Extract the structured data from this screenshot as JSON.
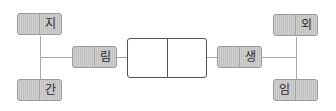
{
  "diagram": {
    "type": "fishbone-word-map",
    "left_group": {
      "top_box": {
        "left_text": "",
        "right_text": "지"
      },
      "bottom_box": {
        "left_text": "",
        "right_text": "간"
      },
      "connector_box": {
        "left_text": "",
        "right_text": "림"
      }
    },
    "center_box": {
      "left_text": "",
      "right_text": ""
    },
    "right_group": {
      "connector_box": {
        "left_text": "",
        "right_text": "생"
      },
      "top_box": {
        "left_text": "",
        "right_text": "외"
      },
      "bottom_box": {
        "left_text": "임",
        "right_text": ""
      }
    },
    "colors": {
      "box_fill": "#c6c6c6",
      "box_border": "#9a9a9a",
      "line": "#a8a8a8",
      "center_border": "#555555",
      "text": "#2a2a2a"
    }
  }
}
